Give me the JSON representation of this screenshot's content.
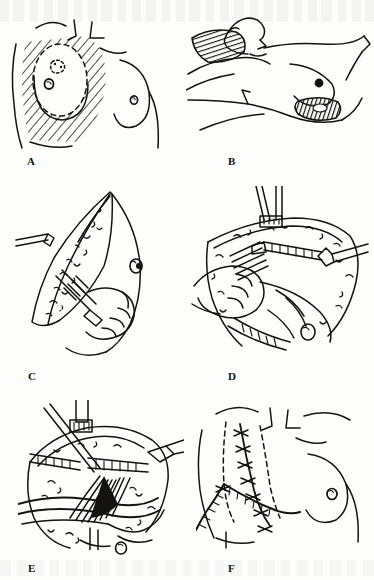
{
  "plate": {
    "title": "Modified radical mastectomy with axillary dissection",
    "medium": "pen-and-ink line drawing",
    "page_background": "#fdfdfb",
    "ink_color": "#15130f",
    "panel_count": 6,
    "grid": "3 rows x 2 columns",
    "has_caption_text": false
  },
  "panels": [
    {
      "label": "A",
      "label_x": 27,
      "label_y": 155,
      "position": "row 1, column 1",
      "subject": "Anterior view of female chest with planned elliptical excision outlined and cross-hatched over the left breast",
      "features": [
        "clavicle and neck contour lines",
        "hatched resection field",
        "dashed elliptical incision outline",
        "tumour marking within ellipse",
        "left nipple-areola inside excision",
        "right breast contour with nipple",
        "lateral chest wall border"
      ]
    },
    {
      "label": "B",
      "label_x": 228,
      "label_y": 155,
      "position": "row 1, column 2",
      "subject": "Patient supine with arm abducted, showing axillary and inframammary incision sites",
      "features": [
        "head and face in profile, turned away",
        "abducted arm across upper field",
        "densely hatched axillary incision",
        "nipple of exposed breast",
        "hatched inframammary incision",
        "torso and flank contours"
      ]
    },
    {
      "label": "C",
      "label_x": 28,
      "label_y": 370,
      "position": "row 2, column 1",
      "subject": "Elevation of the superior skin flap with scalpel dissection, flap retracted upward",
      "features": [
        "raised skin flap with stippled undersurface",
        "surgeon's hand holding scalpel",
        "scalpel blade and hatched handle",
        "retractor tip at upper left",
        "breast contour with nipple at right",
        "subcutaneous fat stippling"
      ]
    },
    {
      "label": "D",
      "label_x": 228,
      "label_y": 370,
      "position": "row 2, column 2",
      "subject": "Deeper flap dissection with counter-traction, toothed clamps securing the wound margin",
      "features": [
        "two clamps on superior flap edge",
        "lateral retractor entering from right",
        "surgeon's hand applying counter-traction",
        "fan of dissected fibres beneath flap",
        "stippled fat along wound edges",
        "nipple-areola on retracted breast tissue"
      ]
    },
    {
      "label": "E",
      "label_x": 28,
      "label_y": 562,
      "position": "row 3, column 1",
      "subject": "Axillary dissection exposing the axillary vein, nerves and lymphatic contents",
      "features": [
        "clamp and forceps entering from above",
        "toothed retractor blades spreading wound",
        "axillary vein retracted by vessel loops",
        "fan of brachial plexus fibres",
        "lymph node and fat stippling",
        "curved retractors crossing field",
        "small nodule marking below field"
      ]
    },
    {
      "label": "F",
      "label_x": 228,
      "label_y": 562,
      "position": "row 3, column 2",
      "subject": "Completed closure showing the sutured transverse scar, flap margins and closed suction drain",
      "features": [
        "interrupted cross-stitch suture line",
        "dashed flap margin outlines",
        "closed suction drain with exit stab wound",
        "drain secured by anchoring stitch",
        "contralateral breast with nipple intact",
        "clavicle and neck contour"
      ]
    }
  ]
}
